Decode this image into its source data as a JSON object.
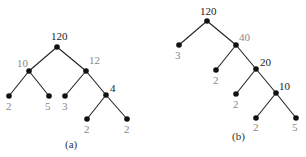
{
  "trees": [
    {
      "caption": "(a)",
      "caption_pos": [
        65,
        148
      ],
      "nodes": [
        {
          "id": "a0",
          "label": "120",
          "x": 57,
          "y": 47,
          "lx": 51,
          "ly": 40,
          "dark": true
        },
        {
          "id": "a1",
          "label": "10",
          "x": 29,
          "y": 71,
          "lx": 17,
          "ly": 67
        },
        {
          "id": "a2",
          "label": "12",
          "x": 86,
          "y": 71,
          "lx": 89,
          "ly": 64
        },
        {
          "id": "a3",
          "label": "2",
          "x": 9,
          "y": 96,
          "lx": 6,
          "ly": 110
        },
        {
          "id": "a4",
          "label": "5",
          "x": 49,
          "y": 96,
          "lx": 45,
          "ly": 110
        },
        {
          "id": "a5",
          "label": "3",
          "x": 65,
          "y": 96,
          "lx": 62,
          "ly": 110
        },
        {
          "id": "a6",
          "label": "4",
          "x": 106,
          "y": 95,
          "lx": 110,
          "ly": 92,
          "dark": true
        },
        {
          "id": "a7",
          "label": "2",
          "x": 87,
          "y": 119,
          "lx": 84,
          "ly": 133
        },
        {
          "id": "a8",
          "label": "2",
          "x": 127,
          "y": 119,
          "lx": 124,
          "ly": 133
        }
      ],
      "edges": [
        [
          "a0",
          "a1"
        ],
        [
          "a0",
          "a2"
        ],
        [
          "a1",
          "a3"
        ],
        [
          "a1",
          "a4"
        ],
        [
          "a2",
          "a5"
        ],
        [
          "a2",
          "a6"
        ],
        [
          "a6",
          "a7"
        ],
        [
          "a6",
          "a8"
        ]
      ]
    },
    {
      "caption": "(b)",
      "caption_pos": [
        232,
        140
      ],
      "nodes": [
        {
          "id": "b0",
          "label": "120",
          "x": 207,
          "y": 21,
          "lx": 200,
          "ly": 15,
          "dark": true
        },
        {
          "id": "b1",
          "label": "3",
          "x": 179,
          "y": 45,
          "lx": 175,
          "ly": 59
        },
        {
          "id": "b2",
          "label": "40",
          "x": 236,
          "y": 45,
          "lx": 239,
          "ly": 41
        },
        {
          "id": "b3",
          "label": "2",
          "x": 216,
          "y": 70,
          "lx": 213,
          "ly": 84
        },
        {
          "id": "b4",
          "label": "20",
          "x": 256,
          "y": 69,
          "lx": 260,
          "ly": 66,
          "dark": true
        },
        {
          "id": "b5",
          "label": "2",
          "x": 236,
          "y": 94,
          "lx": 233,
          "ly": 108
        },
        {
          "id": "b6",
          "label": "10",
          "x": 276,
          "y": 93,
          "lx": 279,
          "ly": 90,
          "dark": true
        },
        {
          "id": "b7",
          "label": "2",
          "x": 256,
          "y": 118,
          "lx": 253,
          "ly": 131
        },
        {
          "id": "b8",
          "label": "5",
          "x": 296,
          "y": 118,
          "lx": 292,
          "ly": 131
        }
      ],
      "edges": [
        [
          "b0",
          "b1"
        ],
        [
          "b0",
          "b2"
        ],
        [
          "b2",
          "b3"
        ],
        [
          "b2",
          "b4"
        ],
        [
          "b4",
          "b5"
        ],
        [
          "b4",
          "b6"
        ],
        [
          "b6",
          "b7"
        ],
        [
          "b6",
          "b8"
        ]
      ]
    }
  ]
}
